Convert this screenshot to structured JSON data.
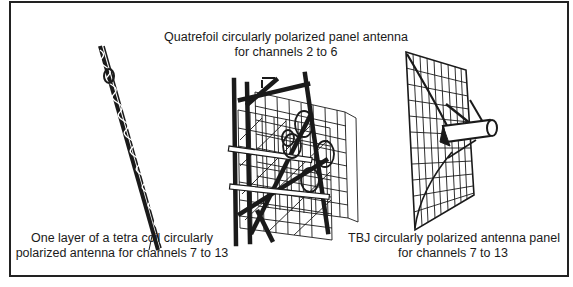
{
  "figure": {
    "panels": [
      {
        "id": "tetra-coil",
        "caption_lines": [
          "One layer of a tetra coil circularly",
          "polarized antenna for channels 7 to 13"
        ]
      },
      {
        "id": "quatrefoil",
        "caption_lines": [
          "Quatrefoil circularly polarized panel antenna",
          "for channels 2 to 6"
        ]
      },
      {
        "id": "tbj",
        "caption_lines": [
          "TBJ circularly polarized antenna panel",
          "for channels 7 to 13"
        ]
      }
    ],
    "colors": {
      "ink": "#1a1a1a",
      "border": "#222222",
      "background": "#ffffff"
    }
  }
}
